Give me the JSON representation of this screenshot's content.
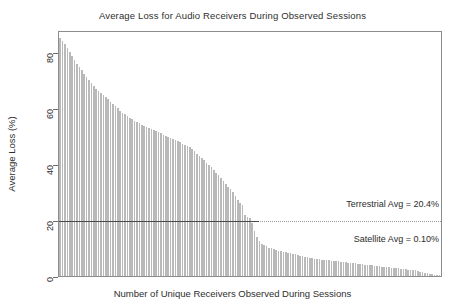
{
  "chart_data": {
    "type": "bar",
    "title": "Average Loss for Audio Receivers During Observed Sessions",
    "xlabel": "Number of Unique Receivers Observed During Sessions",
    "ylabel": "Average Loss (%)",
    "ylim": [
      0,
      88
    ],
    "xlim": [
      0,
      160
    ],
    "grid": false,
    "legend": null,
    "ytick_labels": [
      "0",
      "20",
      "40",
      "60",
      "80"
    ],
    "ytick_values": [
      0,
      20,
      40,
      60,
      80
    ],
    "xtick_labels": [],
    "bar_color": "#b9b9b9",
    "frame_color": "#8d8d8d",
    "annotations": [
      {
        "name": "terrestrial-average",
        "text": "Terrestrial Avg = 20.4%",
        "value": 20.4,
        "line_style": "dotted",
        "line_color": "#9c9c9c"
      },
      {
        "name": "satellite-average",
        "text": "Satellite Avg = 0.10%",
        "value": 0.1,
        "line_style": "none",
        "line_color": "#9c9c9c"
      }
    ],
    "categories": [
      1,
      2,
      3,
      4,
      5,
      6,
      7,
      8,
      9,
      10,
      11,
      12,
      13,
      14,
      15,
      16,
      17,
      18,
      19,
      20,
      21,
      22,
      23,
      24,
      25,
      26,
      27,
      28,
      29,
      30,
      31,
      32,
      33,
      34,
      35,
      36,
      37,
      38,
      39,
      40,
      41,
      42,
      43,
      44,
      45,
      46,
      47,
      48,
      49,
      50,
      51,
      52,
      53,
      54,
      55,
      56,
      57,
      58,
      59,
      60,
      61,
      62,
      63,
      64,
      65,
      66,
      67,
      68,
      69,
      70,
      71,
      72,
      73,
      74,
      75,
      76,
      77,
      78,
      79,
      80,
      81,
      82,
      83,
      84,
      85,
      86,
      87,
      88,
      89,
      90,
      91,
      92,
      93,
      94,
      95,
      96,
      97,
      98,
      99,
      100,
      101,
      102,
      103,
      104,
      105,
      106,
      107,
      108,
      109,
      110,
      111,
      112,
      113,
      114,
      115,
      116,
      117,
      118,
      119,
      120,
      121,
      122,
      123,
      124,
      125,
      126,
      127,
      128,
      129,
      130,
      131,
      132,
      133,
      134,
      135,
      136,
      137,
      138,
      139,
      140,
      141,
      142,
      143,
      144,
      145,
      146,
      147,
      148,
      149,
      150,
      151,
      152,
      153,
      154,
      155,
      156,
      157,
      158,
      159,
      160
    ],
    "values": [
      85.0,
      84.2,
      83.0,
      81.5,
      80.0,
      78.6,
      77.4,
      76.0,
      74.8,
      73.6,
      72.4,
      71.2,
      70.0,
      69.0,
      68.0,
      67.0,
      66.2,
      65.4,
      64.6,
      64.0,
      63.2,
      62.4,
      61.6,
      60.8,
      60.0,
      59.2,
      58.4,
      57.8,
      57.2,
      56.6,
      56.0,
      55.4,
      55.0,
      54.6,
      54.2,
      53.8,
      53.4,
      53.0,
      52.6,
      52.2,
      51.8,
      51.4,
      51.0,
      50.6,
      50.2,
      49.8,
      49.4,
      49.0,
      48.6,
      48.2,
      47.8,
      47.4,
      47.0,
      46.6,
      46.2,
      45.4,
      44.6,
      43.8,
      43.0,
      42.2,
      41.4,
      40.6,
      39.8,
      39.0,
      38.0,
      37.0,
      36.0,
      35.0,
      34.0,
      33.0,
      32.0,
      31.0,
      30.0,
      28.6,
      27.2,
      26.0,
      25.4,
      22.0,
      21.2,
      20.6,
      19.0,
      16.0,
      14.0,
      12.5,
      11.5,
      11.0,
      10.6,
      10.2,
      9.9,
      9.6,
      9.3,
      9.1,
      8.9,
      8.7,
      8.5,
      8.3,
      8.1,
      7.9,
      7.7,
      7.5,
      7.3,
      7.1,
      6.9,
      6.7,
      6.5,
      6.3,
      6.2,
      6.1,
      6.0,
      5.9,
      5.8,
      5.7,
      5.6,
      5.5,
      5.4,
      5.3,
      5.2,
      5.1,
      5.0,
      4.9,
      4.8,
      4.7,
      4.6,
      4.5,
      4.4,
      4.3,
      4.2,
      4.1,
      4.0,
      3.9,
      3.8,
      3.7,
      3.6,
      3.5,
      3.4,
      3.3,
      3.2,
      3.1,
      3.0,
      2.9,
      2.8,
      2.7,
      2.6,
      2.5,
      2.4,
      2.3,
      2.2,
      2.1,
      2.0,
      1.8,
      1.6,
      1.4,
      1.2,
      1.0,
      0.8,
      0.6,
      0.45,
      0.3,
      0.2,
      0.1
    ]
  }
}
